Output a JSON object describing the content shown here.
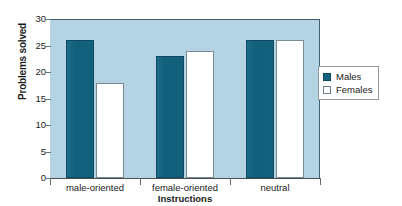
{
  "chart_data": {
    "type": "bar",
    "title": "",
    "xlabel": "Instructions",
    "ylabel": "Problems solved",
    "categories": [
      "male-oriented",
      "female-oriented",
      "neutral"
    ],
    "series": [
      {
        "name": "Males",
        "values": [
          26,
          23,
          26
        ],
        "color": "#15627f"
      },
      {
        "name": "Females",
        "values": [
          18,
          24,
          26
        ],
        "color": "#ffffff"
      }
    ],
    "ylim": [
      0,
      30
    ],
    "yticks": [
      0,
      5,
      10,
      15,
      20,
      25,
      30
    ],
    "ytick_labels": [
      "0",
      "5",
      "10",
      "15",
      "20",
      "25",
      "30"
    ],
    "grid": false,
    "legend_position": "right",
    "plot_background": "#b4d4e4",
    "figure_background": "#ffffff"
  },
  "legend": {
    "entries": [
      {
        "label": "Males",
        "swatch": "filled-square-icon"
      },
      {
        "label": "Females",
        "swatch": "empty-square-icon"
      }
    ]
  }
}
